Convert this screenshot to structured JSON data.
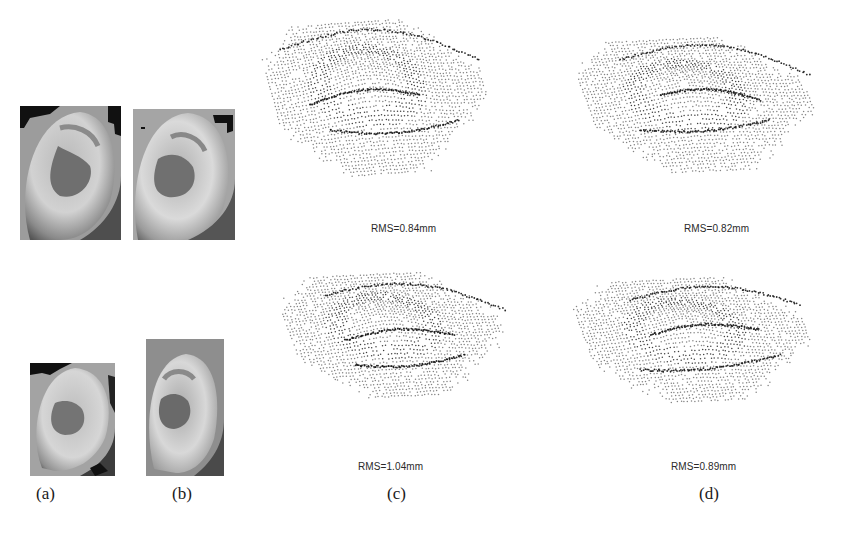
{
  "figure": {
    "columns": [
      {
        "id": "a",
        "label": "(a)"
      },
      {
        "id": "b",
        "label": "(b)"
      },
      {
        "id": "c",
        "label": "(c)"
      },
      {
        "id": "d",
        "label": "(d)"
      }
    ],
    "rows": [
      {
        "row": 1,
        "photo_a": "ear-image-a-row1",
        "photo_b": "ear-image-b-row1",
        "cloud_c_rms": "RMS=0.84mm",
        "cloud_d_rms": "RMS=0.82mm"
      },
      {
        "row": 2,
        "photo_a": "ear-image-a-row2",
        "photo_b": "ear-image-b-row2",
        "cloud_c_rms": "RMS=1.04mm",
        "cloud_d_rms": "RMS=0.89mm"
      }
    ]
  }
}
